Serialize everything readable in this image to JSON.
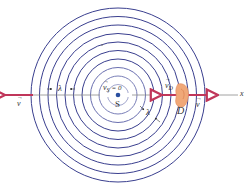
{
  "diagram": {
    "type": "doppler-effect-wavefronts",
    "colors": {
      "wavefront": "#3a3f8f",
      "velocity_arrow": "#c0365a",
      "axis": "#8a8a8a",
      "source_dot": "#2a4fa0",
      "detector": "#f0a878"
    },
    "center": {
      "x": 118,
      "y": 95
    },
    "wavefronts": {
      "count": 10,
      "spacing_px": 8.5,
      "outer_radius_px": 87
    },
    "labels": {
      "source": "S",
      "source_velocity": "v",
      "source_velocity_sub": "S",
      "source_velocity_value": "= 0",
      "detector": "D",
      "detector_velocity": "v",
      "detector_velocity_sub": "D",
      "wave_velocity_left": "v",
      "wave_velocity_right": "v",
      "wavelength_left": "λ",
      "wavelength_diag": "λ",
      "axis": "x"
    }
  }
}
